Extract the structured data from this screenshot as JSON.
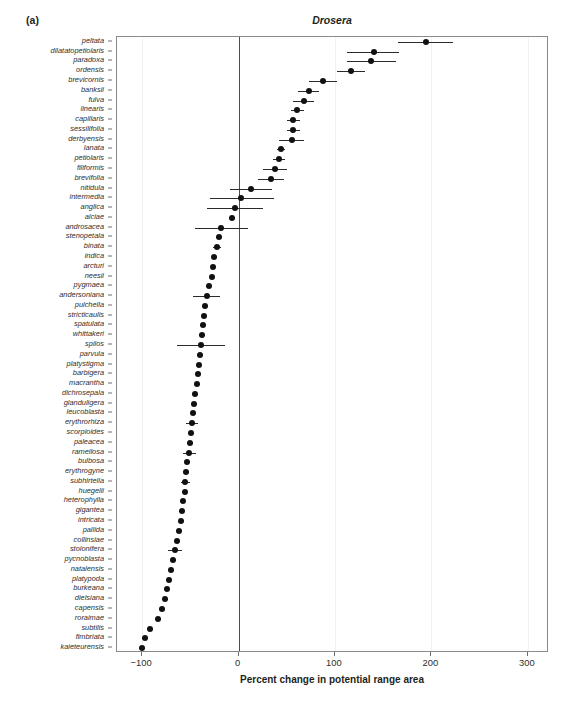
{
  "figure": {
    "panel_letter": "(a)",
    "title": "Drosera",
    "caption": ""
  },
  "axes": {
    "x_title": "Percent change in potential range area",
    "y_title": "Species",
    "x_ticks": [
      -100,
      0,
      100,
      200,
      300
    ],
    "x_tick_labels": [
      "−100",
      "0",
      "100",
      "200",
      "300"
    ],
    "xlim": [
      -126,
      322
    ],
    "zero_reference": 0,
    "grid": "light-vertical"
  },
  "chart_data": {
    "type": "scatter",
    "title": "Drosera",
    "subtitle": "(a)",
    "xlabel": "Percent change in potential range area",
    "ylabel": "Species",
    "xlim": [
      -126,
      322
    ],
    "x_ticks": [
      -100,
      0,
      100,
      200,
      300
    ],
    "grid": true,
    "legend": null,
    "orientation": "horizontal-dot-with-error-bars",
    "point_color": "#111111",
    "error_bar_color": "#2b2b2b",
    "zero_line_color": "#4d4d4d",
    "categories": [
      "peltata",
      "dilatatopetiolaris",
      "paradoxa",
      "ordensis",
      "brevicornis",
      "banksii",
      "fulva",
      "linearis",
      "capillaris",
      "sessilifolia",
      "derbyensis",
      "lanata",
      "petiolaris",
      "filiformis",
      "brevifolia",
      "nitidula",
      "intermedia",
      "anglica",
      "alciae",
      "androsacea",
      "stenopetala",
      "binata",
      "indica",
      "arcturi",
      "neesii",
      "pygmaea",
      "andersoniana",
      "pulchella",
      "stricticaulis",
      "spatulata",
      "whittakeri",
      "spilos",
      "parvula",
      "platystigma",
      "barbigera",
      "macrantha",
      "dichrosepala",
      "glanduligera",
      "leucoblasta",
      "erythrorhiza",
      "scorpioides",
      "paleacea",
      "ramellosa",
      "bulbosa",
      "erythrogyne",
      "subhirtella",
      "huegelii",
      "heterophylla",
      "gigantea",
      "intricata",
      "pallida",
      "collinsiae",
      "stolonifera",
      "pycnoblasta",
      "natalensis",
      "platypoda",
      "burkeana",
      "dielsiana",
      "capensis",
      "roraimae",
      "subtilis",
      "fimbriata",
      "kaieteurensis"
    ],
    "values": [
      194,
      140,
      137,
      117,
      88,
      73,
      68,
      61,
      57,
      57,
      55,
      44,
      42,
      38,
      34,
      13,
      3,
      -4,
      -7,
      -18,
      -20,
      -22,
      -25,
      -26,
      -28,
      -31,
      -33,
      -35,
      -36,
      -37,
      -38,
      -39,
      -40,
      -41,
      -42,
      -43,
      -45,
      -46,
      -47,
      -48,
      -49,
      -50,
      -51,
      -53,
      -54,
      -55,
      -56,
      -58,
      -59,
      -60,
      -62,
      -64,
      -66,
      -68,
      -70,
      -72,
      -74,
      -76,
      -79,
      -83,
      -92,
      -97,
      -100
    ],
    "ci_low": [
      165,
      113,
      112,
      102,
      73,
      62,
      57,
      54,
      50,
      50,
      42,
      40,
      36,
      25,
      20,
      -9,
      -30,
      -33,
      -9,
      -45,
      -23,
      -26,
      -28,
      -29,
      -31,
      -34,
      -47,
      -38,
      -39,
      -40,
      -41,
      -64,
      -43,
      -44,
      -45,
      -46,
      -48,
      -49,
      -50,
      -54,
      -52,
      -53,
      -58,
      -56,
      -57,
      -60,
      -59,
      -61,
      -62,
      -63,
      -65,
      -67,
      -73,
      -71,
      -73,
      -75,
      -77,
      -79,
      -82,
      -86,
      -95,
      -100,
      -103
    ],
    "ci_high": [
      222,
      166,
      163,
      131,
      102,
      83,
      78,
      68,
      64,
      64,
      68,
      48,
      48,
      50,
      47,
      35,
      37,
      25,
      -5,
      10,
      -17,
      -18,
      -22,
      -23,
      -25,
      -28,
      -19,
      -32,
      -33,
      -34,
      -35,
      -14,
      -37,
      -38,
      -39,
      -40,
      -42,
      -43,
      -44,
      -42,
      -46,
      -47,
      -44,
      -50,
      -51,
      -50,
      -53,
      -55,
      -56,
      -57,
      -59,
      -61,
      -59,
      -65,
      -67,
      -69,
      -71,
      -73,
      -76,
      -80,
      -89,
      -94,
      -97
    ]
  }
}
